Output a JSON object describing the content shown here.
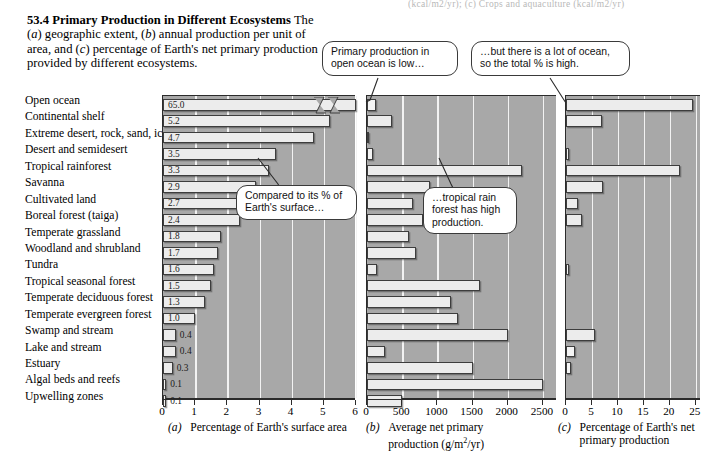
{
  "top_strip_text": "(kcal/m2/yr); (c) Crops and aquaculture (kcal/m2/yr)",
  "figure": {
    "number": "53.4",
    "title": "Primary Production in Different Ecosystems",
    "body_1": "The (",
    "body_a": "a",
    "body_2": ") geographic extent, (",
    "body_b": "b",
    "body_3": ") annual production per unit of area, and (",
    "body_c": "c",
    "body_4": ") percentage of Earth's net primary production provided by different ecosystems."
  },
  "callouts": {
    "open_ocean_low": "Primary production in open ocean is low…",
    "lot_of_ocean": "…but there is a lot of ocean, so the total % is high.",
    "compared_surface": "Compared to its % of Earth's surface…",
    "tropical_rain_high": "…tropical rain forest has high production."
  },
  "ecosystems": [
    "Open ocean",
    "Continental shelf",
    "Extreme desert, rock, sand, ice",
    "Desert and semidesert",
    "Tropical rainforest",
    "Savanna",
    "Cultivated land",
    "Boreal forest (taiga)",
    "Temperate grassland",
    "Woodland and shrubland",
    "Tundra",
    "Tropical seasonal forest",
    "Temperate deciduous forest",
    "Temperate evergreen forest",
    "Swamp and stream",
    "Lake and stream",
    "Estuary",
    "Algal beds and reefs",
    "Upwelling zones"
  ],
  "chart_data": [
    {
      "type": "bar",
      "panel": "a",
      "panel_label": "(a)",
      "title": "Percentage of Earth's surface area",
      "xlabel": "Percentage of Earth's surface area",
      "ylabel": "",
      "orientation": "horizontal",
      "axis_break": true,
      "axis_break_note": "Open ocean bar (65.0) is broken; axis scale ends at 6",
      "xlim": [
        0,
        6
      ],
      "xticks": [
        0,
        1,
        2,
        3,
        4,
        5,
        6
      ],
      "xticklabels": [
        "0",
        "1",
        "2",
        "3",
        "4",
        "5",
        "6"
      ],
      "grid": true,
      "categories": [
        "Open ocean",
        "Continental shelf",
        "Extreme desert, rock, sand, ice",
        "Desert and semidesert",
        "Tropical rainforest",
        "Savanna",
        "Cultivated land",
        "Boreal forest (taiga)",
        "Temperate grassland",
        "Woodland and shrubland",
        "Tundra",
        "Tropical seasonal forest",
        "Temperate deciduous forest",
        "Temperate evergreen forest",
        "Swamp and stream",
        "Lake and stream",
        "Estuary",
        "Algal beds and reefs",
        "Upwelling zones"
      ],
      "values": [
        65.0,
        5.2,
        4.7,
        3.5,
        3.3,
        2.9,
        2.7,
        2.4,
        1.8,
        1.7,
        1.6,
        1.5,
        1.3,
        1.0,
        0.4,
        0.4,
        0.3,
        0.1,
        0.1
      ],
      "datalabels": [
        "65.0",
        "5.2",
        "4.7",
        "3.5",
        "3.3",
        "2.9",
        "2.7",
        "2.4",
        "1.8",
        "1.7",
        "1.6",
        "1.5",
        "1.3",
        "1.0",
        "0.4",
        "0.4",
        "0.3",
        "0.1",
        "0.1"
      ]
    },
    {
      "type": "bar",
      "panel": "b",
      "panel_label": "(b)",
      "title": "Average net primary production (g/m2/yr)",
      "xlabel_line1": "Average net primary",
      "xlabel_line2_pre": "production (g/m",
      "xlabel_line2_sup": "2",
      "xlabel_line2_post": "/yr)",
      "orientation": "horizontal",
      "xlim": [
        0,
        2700
      ],
      "xticks": [
        0,
        500,
        1000,
        1500,
        2000,
        2500
      ],
      "xticklabels": [
        "0",
        "500",
        "1000",
        "1500",
        "2000",
        "2500"
      ],
      "grid": true,
      "categories": [
        "Open ocean",
        "Continental shelf",
        "Extreme desert, rock, sand, ice",
        "Desert and semidesert",
        "Tropical rainforest",
        "Savanna",
        "Cultivated land",
        "Boreal forest (taiga)",
        "Temperate grassland",
        "Woodland and shrubland",
        "Tundra",
        "Tropical seasonal forest",
        "Temperate deciduous forest",
        "Temperate evergreen forest",
        "Swamp and stream",
        "Lake and stream",
        "Estuary",
        "Algal beds and reefs",
        "Upwelling zones"
      ],
      "values": [
        125,
        360,
        3,
        90,
        2200,
        900,
        650,
        800,
        600,
        700,
        140,
        1600,
        1200,
        1300,
        2000,
        250,
        1500,
        2500,
        500
      ]
    },
    {
      "type": "bar",
      "panel": "c",
      "panel_label": "(c)",
      "title": "Percentage of Earth's net primary production",
      "xlabel_line1": "Percentage of Earth's net",
      "xlabel_line2": "primary production",
      "orientation": "horizontal",
      "xlim": [
        0,
        26
      ],
      "xticks": [
        0,
        5,
        10,
        15,
        20,
        25
      ],
      "xticklabels": [
        "0",
        "5",
        "10",
        "15",
        "20",
        "25"
      ],
      "grid": true,
      "categories": [
        "Open ocean",
        "Continental shelf",
        "Extreme desert, rock, sand, ice",
        "Desert and semidesert",
        "Tropical rainforest",
        "Savanna",
        "Cultivated land",
        "Boreal forest (taiga)",
        "Temperate grassland",
        "Woodland and shrubland",
        "Tundra",
        "Tropical seasonal forest",
        "Temperate deciduous forest",
        "Temperate evergreen forest",
        "Swamp and stream",
        "Lake and stream",
        "Estuary",
        "Algal beds and reefs",
        "Upwelling zones"
      ],
      "values": [
        24.4,
        7.0,
        0.0,
        0.5,
        22.0,
        7.1,
        2.3,
        3.0,
        0.0,
        0.0,
        0.5,
        0.0,
        0.0,
        0.0,
        5.6,
        1.7,
        1.0,
        0.0,
        0.0
      ]
    }
  ],
  "colors": {
    "plot_background": "#a8a8a8",
    "bar_fill": "#ececec",
    "bar_border": "#3d3d3d",
    "gridline": "#f2f2f2",
    "axis": "#2b2b2b",
    "callout_border": "#3a3a3a",
    "page_background": "#ffffff"
  }
}
